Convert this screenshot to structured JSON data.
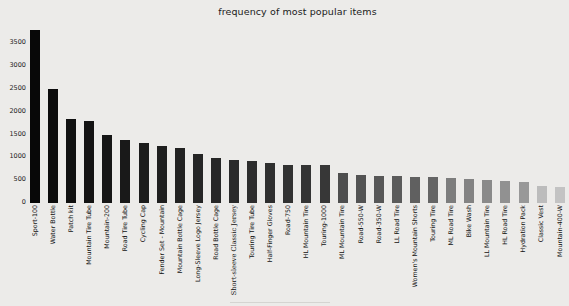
{
  "page": {
    "background_color": "#ecebe9",
    "text_color": "#111111"
  },
  "chart_data": {
    "type": "bar",
    "title": "frequency of most popular items",
    "xlabel": "",
    "ylabel": "",
    "grid": false,
    "legend": "none",
    "ylim": [
      0,
      3900
    ],
    "yticks": [
      0,
      500,
      1000,
      1500,
      2000,
      2500,
      3000,
      3500
    ],
    "categories": [
      "Sport-100",
      "Water Bottle",
      "Patch kit",
      "Mountain Tire Tube",
      "Mountain-200",
      "Road Tire Tube",
      "Cycling Cap",
      "Fender Set - Mountain",
      "Mountain Bottle Cage",
      "Long-Sleeve Logo Jersey",
      "Road Bottle Cage",
      "Short-sleeve Classic Jersey",
      "Touring Tire Tube",
      "Half-Finger Gloves",
      "Road-750",
      "HL Mountain Tire",
      "Touring-1000",
      "ML Mountain Tire",
      "Road-550-W",
      "Road-350-W",
      "LL Road Tire",
      "Women's Mountain Shorts",
      "Touring Tire",
      "ML Road Tire",
      "Bike Wash",
      "LL Mountain Tire",
      "HL Road Tire",
      "Hydration Pack",
      "Classic Vest",
      "Mountain-400-W"
    ],
    "values": [
      3790,
      2500,
      1850,
      1790,
      1490,
      1380,
      1320,
      1240,
      1215,
      1070,
      990,
      950,
      910,
      875,
      835,
      830,
      825,
      665,
      615,
      600,
      585,
      570,
      560,
      545,
      525,
      500,
      485,
      470,
      370,
      340
    ],
    "bar_colors": [
      "#080808",
      "#0c0c0c",
      "#101010",
      "#131313",
      "#161616",
      "#191919",
      "#1c1c1c",
      "#1f1f1f",
      "#222222",
      "#252525",
      "#272727",
      "#2a2a2a",
      "#2d2d2d",
      "#2f2f2f",
      "#323232",
      "#343434",
      "#373737",
      "#4e4e4e",
      "#535353",
      "#575757",
      "#5b5b5b",
      "#606060",
      "#656565",
      "#7d7d7d",
      "#838383",
      "#8a8a8a",
      "#919191",
      "#989898",
      "#bcbcbc",
      "#c3c3c3"
    ],
    "serif_category": "Short-sleeve Classic Jersey"
  }
}
